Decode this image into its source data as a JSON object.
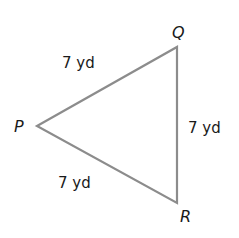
{
  "figure": {
    "type": "triangle",
    "classification": "equilateral",
    "line_color": "#8c8c8c",
    "vertices": [
      {
        "name": "P",
        "label": "P"
      },
      {
        "name": "Q",
        "label": "Q"
      },
      {
        "name": "R",
        "label": "R"
      }
    ],
    "sides": [
      {
        "name": "PQ",
        "label": "7 yd"
      },
      {
        "name": "QR",
        "label": "7 yd"
      },
      {
        "name": "PR",
        "label": "7 yd"
      }
    ]
  }
}
